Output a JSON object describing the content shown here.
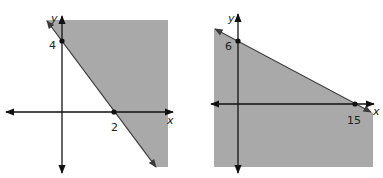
{
  "colors": {
    "shade": "#a9a9a9",
    "line": "#3a3a3a",
    "axis": "#111111",
    "background": "#ffffff"
  },
  "graphs": [
    {
      "id": "left",
      "axis_x_label": "x",
      "axis_y_label": "y",
      "boundary": "solid line through (0,4) and (2,0)",
      "points": [
        {
          "label": "4",
          "x": 0,
          "y": 4
        },
        {
          "label": "2",
          "x": 2,
          "y": 0
        }
      ],
      "shaded_side": "above/right of line"
    },
    {
      "id": "right",
      "axis_x_label": "x",
      "axis_y_label": "y",
      "boundary": "solid line through (0,6) and (15,0)",
      "points": [
        {
          "label": "6",
          "x": 0,
          "y": 6
        },
        {
          "label": "15",
          "x": 15,
          "y": 0
        }
      ],
      "shaded_side": "below/left of line"
    }
  ]
}
